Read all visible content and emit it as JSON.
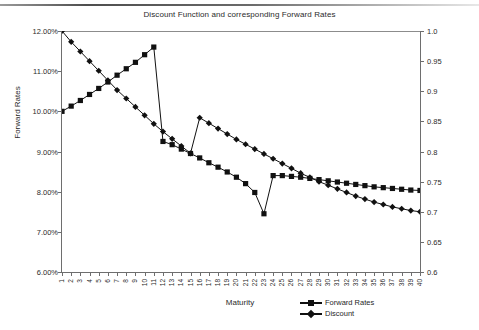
{
  "chart_data": {
    "type": "line",
    "title": "Discount Function and corresponding Forward Rates",
    "xlabel": "Maturity",
    "ylabel": "Forward Rates",
    "y2label": "Discount function",
    "grid": false,
    "legend_position": "bottom-right",
    "xlim": [
      1,
      40
    ],
    "ylim": [
      0.06,
      0.12
    ],
    "y2lim": [
      0.6,
      1.0
    ],
    "ytick_labels": [
      "12.00%",
      "11.00%",
      "10.00%",
      "9.00%",
      "8.00%",
      "7.00%",
      "6.00%"
    ],
    "ytick_values": [
      0.12,
      0.11,
      0.1,
      0.09,
      0.08,
      0.07,
      0.06
    ],
    "y2tick_labels": [
      "1.0",
      "0.95",
      "0.9",
      "0.85",
      "0.8",
      "0.75",
      "0.7",
      "0.65",
      "0.6"
    ],
    "y2tick_values": [
      1.0,
      0.95,
      0.9,
      0.85,
      0.8,
      0.75,
      0.7,
      0.65,
      0.6
    ],
    "x": [
      1,
      2,
      3,
      4,
      5,
      6,
      7,
      8,
      9,
      10,
      11,
      12,
      13,
      14,
      15,
      16,
      17,
      18,
      19,
      20,
      21,
      22,
      23,
      24,
      25,
      26,
      27,
      28,
      29,
      30,
      31,
      32,
      33,
      34,
      35,
      36,
      37,
      38,
      39,
      40
    ],
    "xtick_labels": [
      "1",
      "2",
      "3",
      "4",
      "5",
      "6",
      "7",
      "8",
      "9",
      "10",
      "11",
      "12",
      "13",
      "14",
      "15",
      "16",
      "17",
      "18",
      "19",
      "20",
      "21",
      "22",
      "23",
      "24",
      "25",
      "26",
      "27",
      "28",
      "29",
      "30",
      "31",
      "32",
      "33",
      "34",
      "35",
      "36",
      "37",
      "38",
      "39",
      "40"
    ],
    "series": [
      {
        "name": "Forward Rates",
        "axis": "left",
        "marker": "square",
        "color": "#111111",
        "values": [
          0.1,
          0.1013,
          0.1027,
          0.1042,
          0.1057,
          0.1073,
          0.109,
          0.1106,
          0.1122,
          0.1141,
          0.116,
          0.0925,
          0.0917,
          0.0906,
          0.0895,
          0.0884,
          0.0872,
          0.0861,
          0.0849,
          0.0836,
          0.082,
          0.0798,
          0.0745,
          0.084,
          0.084,
          0.0838,
          0.0836,
          0.0833,
          0.083,
          0.0827,
          0.0824,
          0.0821,
          0.0818,
          0.0815,
          0.0812,
          0.081,
          0.0808,
          0.0806,
          0.0804,
          0.0803
        ]
      },
      {
        "name": "Discount",
        "axis": "right",
        "marker": "diamond",
        "color": "#111111",
        "values": [
          1.0,
          0.982,
          0.966,
          0.95,
          0.934,
          0.918,
          0.902,
          0.888,
          0.874,
          0.86,
          0.846,
          0.833,
          0.821,
          0.809,
          0.797,
          0.856,
          0.847,
          0.838,
          0.829,
          0.82,
          0.812,
          0.804,
          0.796,
          0.788,
          0.78,
          0.772,
          0.764,
          0.757,
          0.75,
          0.744,
          0.738,
          0.732,
          0.726,
          0.721,
          0.716,
          0.712,
          0.708,
          0.705,
          0.702,
          0.7
        ]
      }
    ],
    "legend": [
      {
        "label": "Forward Rates",
        "marker": "square"
      },
      {
        "label": "Discount",
        "marker": "diamond"
      }
    ]
  }
}
